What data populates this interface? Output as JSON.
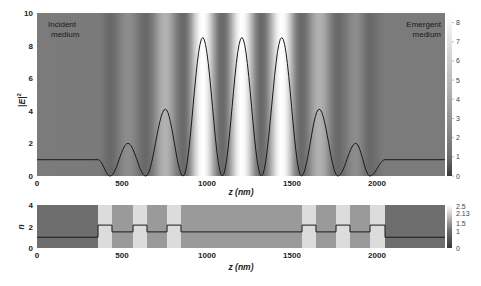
{
  "chart_data": [
    {
      "type": "line",
      "panel": "top",
      "title": "",
      "xlabel": "z (nm)",
      "ylabel": "|E|²",
      "xlim": [
        0,
        2400
      ],
      "ylim": [
        0,
        10
      ],
      "x_ticks": [
        0,
        500,
        1000,
        1500,
        2000
      ],
      "y_ticks": [
        0,
        2,
        4,
        6,
        8,
        10
      ],
      "annotations": [
        "Incident medium",
        "Emergent medium"
      ],
      "colorbar": {
        "ticks": [
          0,
          1,
          2,
          3,
          4,
          5,
          6,
          7,
          8
        ],
        "range": [
          0,
          8.5
        ]
      },
      "series": [
        {
          "name": "|E|^2",
          "x": [
            0,
            359,
            430,
            535,
            640,
            755,
            860,
            975,
            1090,
            1205,
            1320,
            1440,
            1555,
            1660,
            1770,
            1875,
            1959,
            2047,
            2400
          ],
          "y": [
            1,
            1,
            0,
            2.0,
            0,
            4.1,
            0,
            8.5,
            0,
            8.5,
            0,
            8.5,
            0,
            4.1,
            0,
            2.0,
            0,
            1,
            1
          ]
        }
      ]
    },
    {
      "type": "line",
      "panel": "bottom",
      "title": "",
      "xlabel": "z (nm)",
      "ylabel": "n",
      "xlim": [
        0,
        2400
      ],
      "ylim": [
        0,
        4
      ],
      "x_ticks": [
        0,
        500,
        1000,
        1500,
        2000
      ],
      "y_ticks": [
        0,
        2,
        4
      ],
      "colorbar": {
        "ticks": [
          0,
          1,
          1.5,
          2.13,
          2.5
        ],
        "range": [
          0,
          2.5
        ]
      },
      "layers": [
        {
          "z0": 0,
          "z1": 359,
          "n": 1
        },
        {
          "z0": 359,
          "z1": 441,
          "n": 2.13
        },
        {
          "z0": 441,
          "z1": 565,
          "n": 1.5
        },
        {
          "z0": 565,
          "z1": 647,
          "n": 2.13
        },
        {
          "z0": 647,
          "z1": 765,
          "n": 1.5
        },
        {
          "z0": 765,
          "z1": 847,
          "n": 2.13
        },
        {
          "z0": 847,
          "z1": 1559,
          "n": 1.5
        },
        {
          "z0": 1559,
          "z1": 1641,
          "n": 2.13
        },
        {
          "z0": 1641,
          "z1": 1759,
          "n": 1.5
        },
        {
          "z0": 1759,
          "z1": 1841,
          "n": 2.13
        },
        {
          "z0": 1841,
          "z1": 1959,
          "n": 1.5
        },
        {
          "z0": 1959,
          "z1": 2047,
          "n": 2.13
        },
        {
          "z0": 2047,
          "z1": 2400,
          "n": 1
        }
      ]
    }
  ],
  "labels": {
    "top_ylabel": "|E|",
    "top_ylabel_sup": "2",
    "top_xlabel": "z (nm)",
    "bottom_ylabel": "n",
    "bottom_xlabel": "z (nm)",
    "incident_line1": "Incident",
    "incident_line2": "medium",
    "emergent_line1": "Emergent",
    "emergent_line2": "medium"
  },
  "ticks": {
    "x": [
      "0",
      "500",
      "1000",
      "1500",
      "2000"
    ],
    "top_y": [
      "0",
      "2",
      "4",
      "6",
      "8",
      "10"
    ],
    "top_cb": [
      "0",
      "1",
      "2",
      "3",
      "4",
      "5",
      "6",
      "7",
      "8"
    ],
    "bottom_y": [
      "0",
      "2",
      "4"
    ],
    "bottom_cb": [
      "0",
      "1",
      "1.5",
      "2.13",
      "2.5"
    ]
  }
}
